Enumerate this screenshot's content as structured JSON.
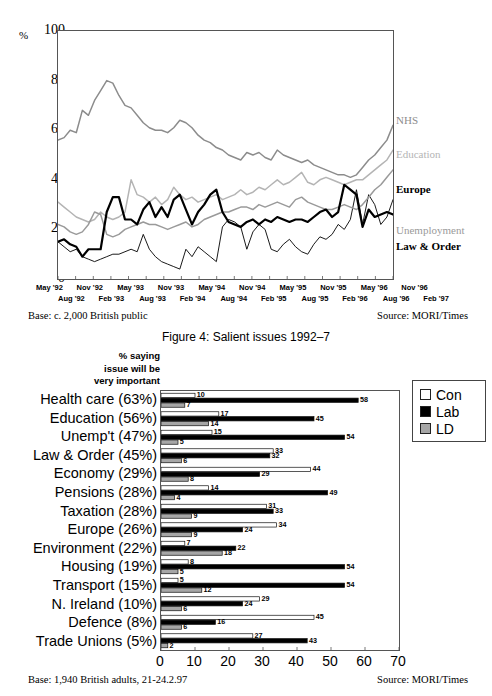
{
  "caption": "Figure 4: Salient issues 1992–7",
  "line_chart": {
    "percent_sign": "%",
    "y_ticks": [
      "100",
      "80",
      "60",
      "40",
      "20",
      "0"
    ],
    "x_row_top": [
      "May '92",
      "Nov '92",
      "May '93",
      "Nov '93",
      "May '94",
      "Nov '94",
      "May '95",
      "Nov '95",
      "May '96",
      "Nov '96"
    ],
    "x_row_bottom": [
      "Aug '92",
      "Feb '93",
      "Aug '93",
      "Feb '94",
      "Aug '94",
      "Feb '95",
      "Aug '95",
      "Feb '96",
      "Aug '96",
      "Feb '97"
    ],
    "series_labels": [
      {
        "name": "NHS",
        "color": "#8c8c8c",
        "bold": false
      },
      {
        "name": "Education",
        "color": "#b4b4b4",
        "bold": false
      },
      {
        "name": "Europe",
        "color": "#000000",
        "bold": true
      },
      {
        "name": "Unemployment",
        "color": "#9a9a9a",
        "bold": false
      },
      {
        "name": "Law & Order",
        "color": "#000000",
        "bold": true
      }
    ],
    "base": "Base: c. 2,000 British public",
    "source": "Source: MORI/Times"
  },
  "bar_chart": {
    "header_lines": [
      "% saying",
      "issue will be",
      "very important"
    ],
    "legend": [
      {
        "label": "Con",
        "color": "#ffffff"
      },
      {
        "label": "Lab",
        "color": "#000000"
      },
      {
        "label": "LD",
        "color": "#a6a6a6"
      }
    ],
    "x_ticks": [
      "0",
      "10",
      "20",
      "30",
      "40",
      "50",
      "60",
      "70"
    ],
    "base": "Base: 1,940 British adults, 21-24.2.97",
    "source": "Source: MORI/Times"
  },
  "chart_data": [
    {
      "type": "line",
      "title": "Figure 4: Salient issues 1992–7",
      "xlabel": "",
      "ylabel": "%",
      "ylim": [
        0,
        100
      ],
      "grid": false,
      "legend_position": "right",
      "x": [
        "May '92",
        "Aug '92",
        "Nov '92",
        "Feb '93",
        "May '93",
        "Aug '93",
        "Nov '93",
        "Feb '94",
        "May '94",
        "Aug '94",
        "Nov '94",
        "Feb '95",
        "May '95",
        "Aug '95",
        "Nov '95",
        "Feb '96",
        "May '96",
        "Aug '96",
        "Nov '96",
        "Feb '97"
      ],
      "series": [
        {
          "name": "NHS",
          "color": "#8c8c8c",
          "values": [
            56,
            57,
            60,
            59,
            68,
            66,
            72,
            76,
            80,
            79,
            74,
            70,
            69,
            66,
            63,
            61,
            60,
            60,
            59,
            61,
            64,
            63,
            61,
            58,
            56,
            55,
            53,
            52,
            50,
            49,
            48,
            51,
            50,
            51,
            49,
            48,
            52,
            50,
            49,
            48,
            47,
            48,
            46,
            45,
            44,
            43,
            42,
            42,
            41,
            42,
            45,
            48,
            50,
            53,
            56,
            62
          ]
        },
        {
          "name": "Education",
          "color": "#b4b4b4",
          "values": [
            31,
            29,
            27,
            25,
            24,
            23,
            24,
            27,
            25,
            24,
            25,
            27,
            40,
            34,
            33,
            31,
            33,
            30,
            32,
            37,
            34,
            32,
            33,
            31,
            32,
            33,
            34,
            32,
            33,
            34,
            36,
            34,
            35,
            37,
            36,
            38,
            40,
            38,
            39,
            41,
            43,
            39,
            38,
            40,
            41,
            40,
            39,
            38,
            39,
            40,
            40,
            42,
            44,
            46,
            48,
            52
          ]
        },
        {
          "name": "Europe",
          "color": "#000000",
          "thin": true,
          "values": [
            15,
            13,
            11,
            12,
            9,
            8,
            7,
            8,
            9,
            10,
            10,
            11,
            12,
            11,
            18,
            12,
            9,
            7,
            6,
            5,
            4,
            12,
            9,
            13,
            11,
            9,
            7,
            21,
            24,
            23,
            21,
            12,
            19,
            22,
            20,
            12,
            11,
            14,
            16,
            13,
            11,
            10,
            14,
            17,
            16,
            18,
            22,
            20,
            24,
            36,
            22,
            34,
            30,
            22,
            25,
            32
          ]
        },
        {
          "name": "Unemployment",
          "color": "#9a9a9a",
          "values": [
            22,
            21,
            19,
            18,
            19,
            22,
            27,
            26,
            18,
            17,
            18,
            20,
            21,
            22,
            23,
            22,
            22,
            21,
            20,
            21,
            22,
            23,
            21,
            22,
            24,
            25,
            26,
            27,
            27,
            28,
            29,
            29,
            28,
            30,
            29,
            30,
            31,
            30,
            29,
            32,
            33,
            31,
            30,
            29,
            28,
            28,
            29,
            30,
            29,
            28,
            30,
            33,
            36,
            38,
            41,
            44
          ]
        },
        {
          "name": "Law & Order",
          "color": "#000000",
          "thick": true,
          "values": [
            15,
            16,
            14,
            13,
            9,
            12,
            12,
            12,
            27,
            33,
            33,
            24,
            24,
            22,
            28,
            31,
            25,
            29,
            25,
            32,
            34,
            28,
            22,
            27,
            30,
            34,
            36,
            27,
            23,
            22,
            21,
            23,
            24,
            22,
            24,
            23,
            25,
            24,
            23,
            24,
            24,
            23,
            25,
            27,
            28,
            25,
            27,
            38,
            36,
            34,
            21,
            28,
            25,
            26,
            27,
            26
          ]
        }
      ]
    },
    {
      "type": "bar",
      "orientation": "horizontal",
      "title": "",
      "xlabel": "",
      "ylabel": "",
      "xlim": [
        0,
        70
      ],
      "grid": false,
      "legend_position": "right",
      "legend": [
        "Con",
        "Lab",
        "LD"
      ],
      "categories": [
        "Health care (63%)",
        "Education (56%)",
        "Unemp't (47%)",
        "Law & Order (45%)",
        "Economy (29%)",
        "Pensions (28%)",
        "Taxation (28%)",
        "Europe (26%)",
        "Environment (22%)",
        "Housing (19%)",
        "Transport (15%)",
        "N. Ireland (10%)",
        "Defence (8%)",
        "Trade Unions (5%)"
      ],
      "series": [
        {
          "name": "Con",
          "color": "#ffffff",
          "values": [
            10,
            17,
            15,
            33,
            44,
            14,
            31,
            34,
            7,
            8,
            5,
            29,
            45,
            27
          ]
        },
        {
          "name": "Lab",
          "color": "#000000",
          "values": [
            58,
            45,
            54,
            32,
            29,
            49,
            33,
            24,
            22,
            54,
            54,
            24,
            16,
            43
          ]
        },
        {
          "name": "LD",
          "color": "#a6a6a6",
          "values": [
            7,
            14,
            5,
            6,
            8,
            4,
            9,
            9,
            18,
            5,
            12,
            6,
            6,
            2
          ]
        }
      ]
    }
  ]
}
